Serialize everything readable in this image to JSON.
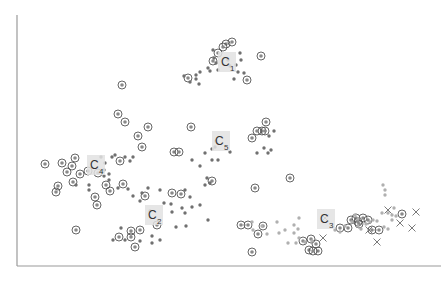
{
  "chart_data": {
    "type": "scatter",
    "title": "",
    "xlabel": "",
    "ylabel": "",
    "grid": false,
    "legend": null,
    "axes": {
      "left_x": 17,
      "bottom_y": 266,
      "top_y": 15,
      "right_x": 441
    },
    "cluster_labels": [
      {
        "name": "C",
        "sub": "1",
        "x": 221,
        "y": 56,
        "w": 18,
        "h": 18
      },
      {
        "name": "C",
        "sub": "4",
        "x": 90,
        "y": 159,
        "w": 18,
        "h": 18
      },
      {
        "name": "C",
        "sub": "5",
        "x": 215,
        "y": 135,
        "w": 18,
        "h": 18
      },
      {
        "name": "C",
        "sub": "2",
        "x": 148,
        "y": 209,
        "w": 18,
        "h": 18
      },
      {
        "name": "C",
        "sub": "3",
        "x": 320,
        "y": 213,
        "w": 18,
        "h": 18
      }
    ],
    "series": [
      {
        "name": "ringed",
        "marker": "circle-with-dot",
        "points": [
          [
            226,
            44
          ],
          [
            232,
            42
          ],
          [
            218,
            53
          ],
          [
            223,
            47
          ],
          [
            213,
            61
          ],
          [
            261,
            56
          ],
          [
            247,
            80
          ],
          [
            188,
            78
          ],
          [
            122,
            85
          ],
          [
            118,
            114
          ],
          [
            125,
            122
          ],
          [
            148,
            127
          ],
          [
            138,
            136
          ],
          [
            191,
            127
          ],
          [
            266,
            122
          ],
          [
            262,
            131
          ],
          [
            265,
            131
          ],
          [
            257,
            131
          ],
          [
            45,
            164
          ],
          [
            62,
            163
          ],
          [
            75,
            158
          ],
          [
            72,
            166
          ],
          [
            80,
            174
          ],
          [
            88,
            171
          ],
          [
            67,
            172
          ],
          [
            58,
            186
          ],
          [
            56,
            192
          ],
          [
            73,
            182
          ],
          [
            98,
            173
          ],
          [
            95,
            197
          ],
          [
            97,
            205
          ],
          [
            120,
            161
          ],
          [
            142,
            147
          ],
          [
            174,
            152
          ],
          [
            179,
            152
          ],
          [
            212,
            181
          ],
          [
            123,
            184
          ],
          [
            106,
            185
          ],
          [
            110,
            191
          ],
          [
            145,
            196
          ],
          [
            172,
            193
          ],
          [
            181,
            194
          ],
          [
            252,
            138
          ],
          [
            290,
            178
          ],
          [
            76,
            230
          ],
          [
            119,
            237
          ],
          [
            131,
            237
          ],
          [
            131,
            231
          ],
          [
            140,
            230
          ],
          [
            157,
            225
          ],
          [
            135,
            247
          ],
          [
            255,
            188
          ],
          [
            241,
            225
          ],
          [
            248,
            225
          ],
          [
            258,
            234
          ],
          [
            263,
            226
          ],
          [
            252,
            252
          ],
          [
            303,
            241
          ],
          [
            311,
            239
          ],
          [
            309,
            250
          ],
          [
            316,
            244
          ],
          [
            318,
            251
          ],
          [
            313,
            251
          ],
          [
            340,
            228
          ],
          [
            348,
            228
          ],
          [
            351,
            220
          ],
          [
            356,
            218
          ],
          [
            359,
            224
          ],
          [
            363,
            218
          ],
          [
            368,
            220
          ],
          [
            358,
            222
          ],
          [
            372,
            230
          ],
          [
            379,
            230
          ],
          [
            402,
            214
          ]
        ]
      },
      {
        "name": "dark",
        "marker": "dot",
        "points": [
          [
            214,
            58
          ],
          [
            216,
            63
          ],
          [
            208,
            68
          ],
          [
            218,
            70
          ],
          [
            228,
            60
          ],
          [
            230,
            66
          ],
          [
            240,
            53
          ],
          [
            241,
            60
          ],
          [
            238,
            72
          ],
          [
            234,
            79
          ],
          [
            236,
            65
          ],
          [
            210,
            71
          ],
          [
            200,
            72
          ],
          [
            196,
            75
          ],
          [
            213,
            50
          ],
          [
            244,
            73
          ],
          [
            190,
            82
          ],
          [
            199,
            84
          ],
          [
            196,
            79
          ],
          [
            184,
            76
          ],
          [
            105,
            163
          ],
          [
            101,
            157
          ],
          [
            125,
            157
          ],
          [
            115,
            155
          ],
          [
            104,
            170
          ],
          [
            104,
            176
          ],
          [
            109,
            174
          ],
          [
            109,
            180
          ],
          [
            89,
            190
          ],
          [
            89,
            185
          ],
          [
            76,
            185
          ],
          [
            118,
            188
          ],
          [
            128,
            189
          ],
          [
            112,
            157
          ],
          [
            130,
            161
          ],
          [
            133,
            157
          ],
          [
            133,
            196
          ],
          [
            140,
            201
          ],
          [
            142,
            193
          ],
          [
            148,
            188
          ],
          [
            160,
            190
          ],
          [
            185,
            190
          ],
          [
            190,
            197
          ],
          [
            205,
            185
          ],
          [
            210,
            183
          ],
          [
            207,
            178
          ],
          [
            164,
            203
          ],
          [
            171,
            204
          ],
          [
            172,
            212
          ],
          [
            182,
            208
          ],
          [
            192,
            207
          ],
          [
            200,
            205
          ],
          [
            208,
            220
          ],
          [
            186,
            226
          ],
          [
            185,
            213
          ],
          [
            176,
            227
          ],
          [
            160,
            240
          ],
          [
            152,
            243
          ],
          [
            152,
            236
          ],
          [
            140,
            241
          ],
          [
            113,
            240
          ],
          [
            216,
            141
          ],
          [
            215,
            147
          ],
          [
            212,
            149
          ],
          [
            212,
            160
          ],
          [
            218,
            160
          ],
          [
            230,
            152
          ],
          [
            205,
            153
          ],
          [
            192,
            160
          ],
          [
            200,
            166
          ],
          [
            257,
            153
          ],
          [
            268,
            153
          ],
          [
            264,
            148
          ],
          [
            271,
            150
          ],
          [
            269,
            136
          ],
          [
            274,
            131
          ],
          [
            121,
            228
          ],
          [
            125,
            240
          ],
          [
            150,
            211
          ]
        ]
      },
      {
        "name": "light",
        "marker": "dot-light",
        "points": [
          [
            252,
            222
          ],
          [
            253,
            230
          ],
          [
            262,
            226
          ],
          [
            277,
            222
          ],
          [
            294,
            225
          ],
          [
            299,
            218
          ],
          [
            298,
            229
          ],
          [
            294,
            233
          ],
          [
            285,
            230
          ],
          [
            279,
            233
          ],
          [
            267,
            234
          ],
          [
            335,
            230
          ],
          [
            340,
            232
          ],
          [
            345,
            226
          ],
          [
            352,
            222
          ],
          [
            358,
            226
          ],
          [
            361,
            229
          ],
          [
            370,
            222
          ],
          [
            373,
            220
          ],
          [
            377,
            221
          ],
          [
            382,
            213
          ],
          [
            388,
            213
          ],
          [
            384,
            227
          ],
          [
            388,
            229
          ],
          [
            392,
            220
          ],
          [
            383,
            185
          ],
          [
            385,
            195
          ],
          [
            385,
            190
          ],
          [
            392,
            215
          ],
          [
            396,
            216
          ],
          [
            394,
            208
          ],
          [
            358,
            219
          ],
          [
            355,
            215
          ],
          [
            366,
            224
          ],
          [
            312,
            241
          ],
          [
            305,
            242
          ],
          [
            296,
            243
          ],
          [
            299,
            238
          ],
          [
            288,
            243
          ]
        ]
      },
      {
        "name": "cross",
        "marker": "x",
        "points": [
          [
            325,
            218
          ],
          [
            323,
            238
          ],
          [
            369,
            230
          ],
          [
            377,
            242
          ],
          [
            388,
            210
          ],
          [
            400,
            223
          ],
          [
            416,
            212
          ],
          [
            412,
            228
          ]
        ]
      }
    ]
  }
}
